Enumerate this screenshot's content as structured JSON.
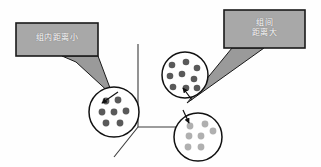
{
  "figure": {
    "background_color": "#fefefe",
    "width": 321,
    "height": 167
  },
  "colors": {
    "callout_fill": "#a8a8a8",
    "callout_border": "#1a1a1a",
    "callout_text": "#ffffff",
    "tail_fill": "#9a9a9a",
    "circle_stroke": "#111111",
    "dot_dark": "#5a5a5a",
    "dot_light": "#b0b0b0",
    "axis_stroke": "#3a3a3a",
    "arrow_stroke": "#111111"
  },
  "callouts": [
    {
      "id": "within-group",
      "text": "组内距离小",
      "meaning": "small-within-group-distance",
      "box": {
        "x": 16,
        "y": 23,
        "width": 82,
        "height": 33
      },
      "tail_tip": {
        "x": 113,
        "y": 96
      }
    },
    {
      "id": "between-group",
      "text": "组间\n距离大",
      "meaning": "large-between-group-distance",
      "box": {
        "x": 224,
        "y": 10,
        "width": 81,
        "height": 38
      },
      "tail_tip": {
        "x": 187,
        "y": 103
      }
    }
  ],
  "axes": {
    "origin": {
      "x": 138,
      "y": 127
    },
    "vertical_top": {
      "x": 138,
      "y": 44
    },
    "horizontal_right": {
      "x": 200,
      "y": 127
    },
    "diagonal_end": {
      "x": 114,
      "y": 157
    }
  },
  "clusters": [
    {
      "id": "cluster-left",
      "tone": "dark",
      "center": {
        "x": 114,
        "y": 112
      },
      "radius": 25,
      "dot_count": 7,
      "dot_radius": 3.4,
      "dots": [
        {
          "x": 106,
          "y": 101
        },
        {
          "x": 118,
          "y": 100
        },
        {
          "x": 102,
          "y": 112
        },
        {
          "x": 114,
          "y": 112
        },
        {
          "x": 126,
          "y": 111
        },
        {
          "x": 106,
          "y": 123
        },
        {
          "x": 120,
          "y": 123
        }
      ]
    },
    {
      "id": "cluster-upper-right",
      "tone": "dark",
      "center": {
        "x": 185,
        "y": 75
      },
      "radius": 23,
      "dot_count": 9,
      "dot_radius": 3.3,
      "dots": [
        {
          "x": 172,
          "y": 65
        },
        {
          "x": 186,
          "y": 62
        },
        {
          "x": 197,
          "y": 68
        },
        {
          "x": 170,
          "y": 76
        },
        {
          "x": 182,
          "y": 74
        },
        {
          "x": 194,
          "y": 79
        },
        {
          "x": 173,
          "y": 87
        },
        {
          "x": 186,
          "y": 88
        },
        {
          "x": 197,
          "y": 88
        }
      ]
    },
    {
      "id": "cluster-lower-right",
      "tone": "light",
      "center": {
        "x": 198,
        "y": 137
      },
      "radius": 24,
      "dot_count": 7,
      "dot_radius": 3.4,
      "dots": [
        {
          "x": 190,
          "y": 126
        },
        {
          "x": 205,
          "y": 124
        },
        {
          "x": 189,
          "y": 136
        },
        {
          "x": 201,
          "y": 136
        },
        {
          "x": 213,
          "y": 131
        },
        {
          "x": 188,
          "y": 147
        },
        {
          "x": 201,
          "y": 147
        }
      ]
    }
  ],
  "arrows": [
    {
      "id": "arrow-into-left-cluster",
      "from": {
        "x": 118,
        "y": 92
      },
      "to": {
        "x": 101,
        "y": 103
      }
    },
    {
      "id": "arrow-into-upper-right-cluster",
      "from": {
        "x": 192,
        "y": 100
      },
      "to": {
        "x": 182,
        "y": 87
      }
    },
    {
      "id": "arrow-into-lower-right-cluster",
      "from": {
        "x": 183,
        "y": 110
      },
      "to": {
        "x": 189,
        "y": 124
      }
    }
  ]
}
